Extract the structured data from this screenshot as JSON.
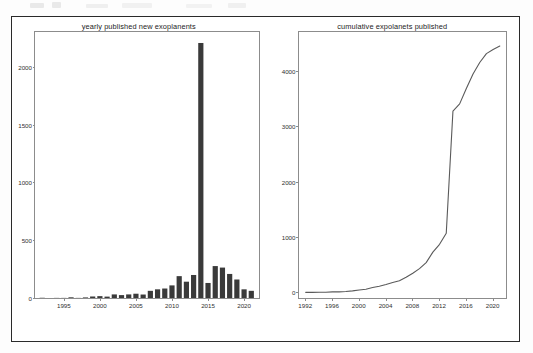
{
  "figure": {
    "background": "#ffffff",
    "border_color": "#2a2a2a",
    "page_background": "#fdfdfd"
  },
  "chart_data": [
    {
      "type": "bar",
      "title": "yearly published new exoplanents",
      "xlabel": "",
      "ylabel": "",
      "xlim": [
        1991,
        2022
      ],
      "ylim": [
        0,
        2300
      ],
      "xticks": [
        1995,
        2000,
        2005,
        2010,
        2015,
        2020
      ],
      "yticks": [
        0,
        500,
        1000,
        1500,
        2000
      ],
      "grid": false,
      "legend": false,
      "bar_color": "#3a3a3a",
      "categories": [
        1992,
        1993,
        1994,
        1995,
        1996,
        1997,
        1998,
        1999,
        2000,
        2001,
        2002,
        2003,
        2004,
        2005,
        2006,
        2007,
        2008,
        2009,
        2010,
        2011,
        2012,
        2013,
        2014,
        2015,
        2016,
        2017,
        2018,
        2019,
        2020,
        2021
      ],
      "values": [
        2,
        0,
        1,
        1,
        6,
        1,
        5,
        13,
        16,
        12,
        31,
        25,
        31,
        37,
        30,
        62,
        75,
        82,
        109,
        189,
        141,
        199,
        2205,
        130,
        276,
        263,
        208,
        160,
        75,
        62
      ]
    },
    {
      "type": "line",
      "title": "cumulative expolanets published",
      "xlabel": "",
      "ylabel": "",
      "xlim": [
        1991,
        2022
      ],
      "ylim": [
        -100,
        4700
      ],
      "xticks": [
        1992,
        1996,
        2000,
        2004,
        2008,
        2012,
        2016,
        2020
      ],
      "yticks": [
        0,
        1000,
        2000,
        3000,
        4000
      ],
      "grid": false,
      "legend": false,
      "line_color": "#5a5a5a",
      "x": [
        1992,
        1993,
        1994,
        1995,
        1996,
        1997,
        1998,
        1999,
        2000,
        2001,
        2002,
        2003,
        2004,
        2005,
        2006,
        2007,
        2008,
        2009,
        2010,
        2011,
        2012,
        2013,
        2014,
        2015,
        2016,
        2017,
        2018,
        2019,
        2020,
        2021
      ],
      "values": [
        2,
        2,
        3,
        4,
        10,
        11,
        16,
        29,
        45,
        57,
        88,
        113,
        144,
        181,
        211,
        273,
        348,
        430,
        539,
        728,
        869,
        1068,
        3273,
        3403,
        3679,
        3942,
        4150,
        4310,
        4385,
        4447
      ]
    }
  ]
}
